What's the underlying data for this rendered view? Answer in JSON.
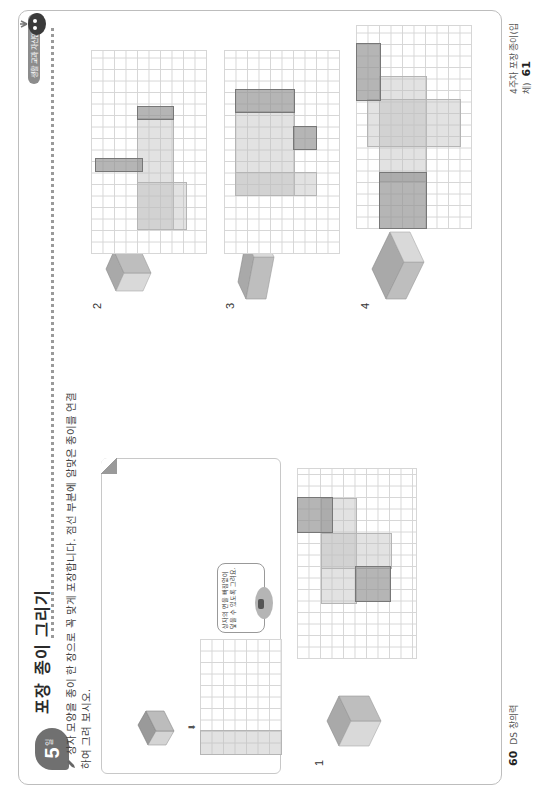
{
  "header": {
    "day_number": "5",
    "day_unit": "일",
    "title": "포장 종이 그리기",
    "tag": "생활 교과 자신만들기"
  },
  "instruction": "상자 모양을 종이 한 장으로 꼭 맞게 포장합니다. 점선 부분에 알맞은 종이를 연결하여 그려 보시오.",
  "example": {
    "arrow": "⬇",
    "speech_bubble": "상자의 면을 빠짐없이 덮을 수 있도록 그려요."
  },
  "problems": [
    {
      "number": "1",
      "box_icon": "cube-3x3x3"
    },
    {
      "number": "2",
      "box_icon": "box-2x3x4"
    },
    {
      "number": "3",
      "box_icon": "box-2x2x5"
    },
    {
      "number": "4",
      "box_icon": "box-2x4x4"
    }
  ],
  "footer": {
    "left_page": "60",
    "left_label": "DS 창의력",
    "right_page": "61",
    "right_label": "4주차 포장 종이(입체)"
  },
  "colors": {
    "light_face": "#d9d9d9",
    "dark_face": "#a6a6a6",
    "grid_line": "#d6d6d6",
    "accent": "#707070"
  }
}
